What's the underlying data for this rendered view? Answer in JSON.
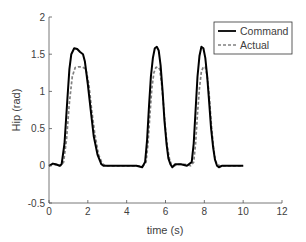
{
  "chart_data": {
    "type": "line",
    "title": "",
    "xlabel": "time (s)",
    "ylabel": "Hip (rad)",
    "xlim": [
      0,
      12
    ],
    "ylim": [
      -0.5,
      2
    ],
    "xticks": [
      0,
      2,
      4,
      6,
      8,
      10,
      12
    ],
    "yticks": [
      -0.5,
      0,
      0.5,
      1,
      1.5,
      2
    ],
    "xtick_labels": [
      "0",
      "2",
      "4",
      "6",
      "8",
      "10",
      "12"
    ],
    "ytick_labels": [
      "-0.5",
      "0",
      "0.5",
      "1",
      "1.5",
      "2"
    ],
    "grid": false,
    "legend_position": "upper right",
    "series": [
      {
        "name": "Command",
        "style": "solid",
        "color": "#000000",
        "x": [
          0,
          0.2,
          0.35,
          0.55,
          0.65,
          0.8,
          0.95,
          1.05,
          1.15,
          1.3,
          1.45,
          1.6,
          1.75,
          1.85,
          2.0,
          2.15,
          2.3,
          2.5,
          2.7,
          2.8,
          3.0,
          3.5,
          4.0,
          4.5,
          4.8,
          4.95,
          5.05,
          5.15,
          5.25,
          5.35,
          5.45,
          5.55,
          5.65,
          5.75,
          5.85,
          5.95,
          6.05,
          6.15,
          6.25,
          6.35,
          6.5,
          6.8,
          7.1,
          7.35,
          7.45,
          7.55,
          7.65,
          7.75,
          7.85,
          7.95,
          8.05,
          8.15,
          8.25,
          8.35,
          8.45,
          8.55,
          8.65,
          8.75,
          8.9,
          9.2,
          9.6,
          10.0
        ],
        "y": [
          0,
          0.03,
          0.02,
          0.0,
          0.02,
          0.3,
          0.9,
          1.3,
          1.5,
          1.58,
          1.57,
          1.53,
          1.5,
          1.4,
          1.1,
          0.75,
          0.4,
          0.15,
          0.02,
          0.0,
          0.0,
          0.0,
          0.0,
          0.0,
          -0.02,
          0.05,
          0.35,
          0.8,
          1.2,
          1.45,
          1.58,
          1.6,
          1.55,
          1.35,
          1.0,
          0.6,
          0.3,
          0.1,
          0.02,
          -0.02,
          0.02,
          0.02,
          0.0,
          0.05,
          0.3,
          0.75,
          1.2,
          1.48,
          1.6,
          1.58,
          1.45,
          1.2,
          0.85,
          0.5,
          0.25,
          0.08,
          0.0,
          -0.02,
          0.0,
          0.0,
          0.0,
          0.0
        ]
      },
      {
        "name": "Actual",
        "style": "dashed",
        "color": "#808080",
        "x": [
          0,
          0.2,
          0.4,
          0.6,
          0.75,
          0.9,
          1.05,
          1.2,
          1.35,
          1.5,
          1.7,
          1.9,
          2.05,
          2.2,
          2.35,
          2.55,
          2.75,
          2.9,
          3.0,
          3.5,
          4.0,
          4.5,
          4.85,
          5.0,
          5.1,
          5.2,
          5.3,
          5.4,
          5.5,
          5.6,
          5.7,
          5.8,
          5.9,
          6.0,
          6.1,
          6.2,
          6.3,
          6.45,
          6.7,
          7.0,
          7.3,
          7.45,
          7.55,
          7.65,
          7.75,
          7.85,
          7.95,
          8.05,
          8.15,
          8.25,
          8.35,
          8.45,
          8.55,
          8.65,
          8.8,
          9.0,
          9.4,
          9.8,
          10.0
        ],
        "y": [
          0,
          0.02,
          0.01,
          0.0,
          0.05,
          0.35,
          0.85,
          1.2,
          1.32,
          1.33,
          1.33,
          1.3,
          1.1,
          0.75,
          0.45,
          0.15,
          0.03,
          0.0,
          0.0,
          0.0,
          0.0,
          0.0,
          0.0,
          0.05,
          0.3,
          0.7,
          1.05,
          1.25,
          1.32,
          1.33,
          1.3,
          1.1,
          0.8,
          0.5,
          0.25,
          0.1,
          0.02,
          0.0,
          0.02,
          0.02,
          0.0,
          0.05,
          0.3,
          0.7,
          1.05,
          1.27,
          1.33,
          1.33,
          1.2,
          0.95,
          0.6,
          0.3,
          0.1,
          0.02,
          0.0,
          0.0,
          0.0,
          0.0,
          0.0
        ]
      }
    ]
  }
}
